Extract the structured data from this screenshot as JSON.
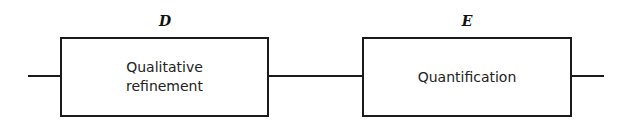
{
  "diagram": {
    "type": "block-flow",
    "blocks": [
      {
        "id": "D",
        "label": "D",
        "text": "Qualitative\nrefinement"
      },
      {
        "id": "E",
        "label": "E",
        "text": "Quantification"
      }
    ],
    "connections": [
      {
        "from": "input",
        "to": "D"
      },
      {
        "from": "D",
        "to": "E"
      },
      {
        "from": "E",
        "to": "output"
      }
    ],
    "colors": {
      "stroke": "#1a1a1a",
      "background": "#ffffff"
    }
  }
}
